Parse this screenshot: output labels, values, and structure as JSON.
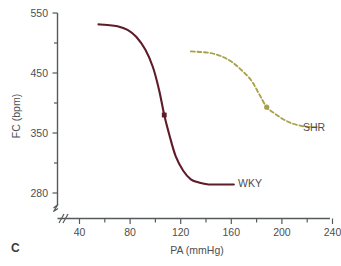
{
  "panel": {
    "label": "C"
  },
  "chart_data": {
    "type": "line",
    "title": "",
    "subtitle": "",
    "xlabel": "PA (mmHg)",
    "ylabel": "FC (bpm)",
    "xlim": [
      20,
      255
    ],
    "ylim": [
      280,
      550
    ],
    "grid": false,
    "legend_position": "inline-right-of-curve",
    "x_ticks_major": [
      40,
      80,
      120,
      160,
      200,
      240
    ],
    "x_ticks_major_labels": [
      "40",
      "80",
      "120",
      "160",
      "200",
      "240"
    ],
    "x_ticks_minor": [
      60,
      100,
      140,
      180,
      220
    ],
    "y_ticks_major": [
      280,
      350,
      450,
      550
    ],
    "y_ticks_major_labels": [
      "280",
      "350",
      "450",
      "550"
    ],
    "y_ticks_minor": [
      315,
      400,
      500
    ],
    "x_axis_break": true,
    "y_axis_break": true,
    "series": [
      {
        "name": "WKY",
        "label": "WKY",
        "color": "#5e1b28",
        "style": "solid",
        "marker": "square",
        "marker_point": {
          "x": 107,
          "y": 380
        },
        "x": [
          55,
          62,
          70,
          78,
          85,
          92,
          98,
          103,
          107,
          111,
          116,
          122,
          128,
          135,
          142,
          150,
          162
        ],
        "y": [
          531,
          530,
          528,
          522,
          510,
          489,
          460,
          421,
          380,
          348,
          323,
          306,
          296,
          292,
          290,
          290,
          290
        ]
      },
      {
        "name": "SHR",
        "label": "SHR",
        "color": "#a8a14a",
        "style": "dashed",
        "marker": "circle",
        "marker_point": {
          "x": 188,
          "y": 393
        },
        "x": [
          128,
          136,
          144,
          152,
          160,
          168,
          176,
          182,
          188,
          194,
          201,
          208,
          215,
          222,
          228
        ],
        "y": [
          486,
          485,
          483,
          478,
          469,
          455,
          437,
          415,
          393,
          383,
          373,
          366,
          362,
          360,
          360
        ]
      }
    ]
  }
}
